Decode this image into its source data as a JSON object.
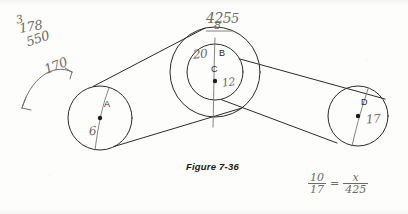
{
  "figure": {
    "caption": "Figure 7-36",
    "type": "belt-and-pulley-diagram"
  },
  "pulleys": [
    {
      "id": "A",
      "label": "A",
      "center": [
        100,
        118
      ],
      "radius": 32,
      "handwritten_radius": "6"
    },
    {
      "id": "B",
      "label": "B",
      "center": [
        215,
        72
      ],
      "radius": 45,
      "handwritten_radius": "20"
    },
    {
      "id": "C",
      "label": "C",
      "center": [
        215,
        72
      ],
      "radius": 28,
      "handwritten_radius": "12"
    },
    {
      "id": "D",
      "label": "D",
      "center": [
        358,
        116
      ],
      "radius": 30,
      "handwritten_radius": "17"
    }
  ],
  "annotations": {
    "top_left_scribble_1": "3",
    "top_left_scribble_2": "178",
    "top_left_scribble_3": "550",
    "arrow_note": "170",
    "top_center_note": "425",
    "top_center_note_sub": "8",
    "top_center_note_tail": "5",
    "radius_b": "20",
    "radius_c": "12",
    "radius_a": "6",
    "radius_d": "17"
  },
  "equation": {
    "left_numerator": "10",
    "left_denominator": "17",
    "equals": "=",
    "right_numerator": "x",
    "right_denominator": "425"
  },
  "colors": {
    "paper": "#fdfdfc",
    "ink_print": "#1a1a1a",
    "ink_pencil": "#6d6a68",
    "line": "#2b2b2b"
  }
}
